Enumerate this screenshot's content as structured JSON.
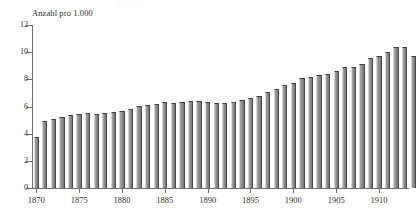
{
  "figure": {
    "clipped_top_text": ". .                                               .    .      .   .",
    "axis_title": "Anzahl pro 1.000",
    "background_color": "#ffffff",
    "bar_color": "#8d8d8d",
    "axis_color": "#6e6e6e"
  },
  "chart_data": {
    "type": "bar",
    "title": "",
    "subtitle": "",
    "xlabel": "",
    "ylabel": "Anzahl pro 1.000",
    "ylim": [
      0,
      12
    ],
    "yticks": [
      0,
      2,
      4,
      6,
      8,
      10,
      12
    ],
    "ytick_labels": [
      "0",
      "2",
      "4",
      "6",
      "8",
      "10",
      "12"
    ],
    "xticks": [
      1870,
      1875,
      1880,
      1885,
      1890,
      1895,
      1900,
      1905,
      1910
    ],
    "xtick_labels": [
      "1870",
      "1875",
      "1880",
      "1885",
      "1890",
      "1895",
      "1900",
      "1905",
      "1910"
    ],
    "xlim": [
      1869.5,
      1913.5
    ],
    "grid": false,
    "legend": null,
    "categories": [
      "1870",
      "1871",
      "1872",
      "1873",
      "1874",
      "1875",
      "1876",
      "1877",
      "1878",
      "1879",
      "1880",
      "1881",
      "1882",
      "1883",
      "1884",
      "1885",
      "1886",
      "1887",
      "1888",
      "1889",
      "1890",
      "1891",
      "1892",
      "1893",
      "1894",
      "1895",
      "1896",
      "1897",
      "1898",
      "1899",
      "1900",
      "1901",
      "1902",
      "1903",
      "1904",
      "1905",
      "1906",
      "1907",
      "1908",
      "1909",
      "1910",
      "1911",
      "1912",
      "1913"
    ],
    "values": [
      3.75,
      4.95,
      5.05,
      5.25,
      5.35,
      5.45,
      5.55,
      5.45,
      5.55,
      5.6,
      5.7,
      5.8,
      6.05,
      6.1,
      6.2,
      6.3,
      6.25,
      6.35,
      6.4,
      6.4,
      6.35,
      6.25,
      6.25,
      6.3,
      6.5,
      6.6,
      6.8,
      7.1,
      7.3,
      7.55,
      7.75,
      8.1,
      8.2,
      8.3,
      8.4,
      8.65,
      8.9,
      8.9,
      9.1,
      9.6,
      9.75,
      10.05,
      10.4,
      10.4
    ],
    "extra_values": [
      9.7
    ]
  }
}
